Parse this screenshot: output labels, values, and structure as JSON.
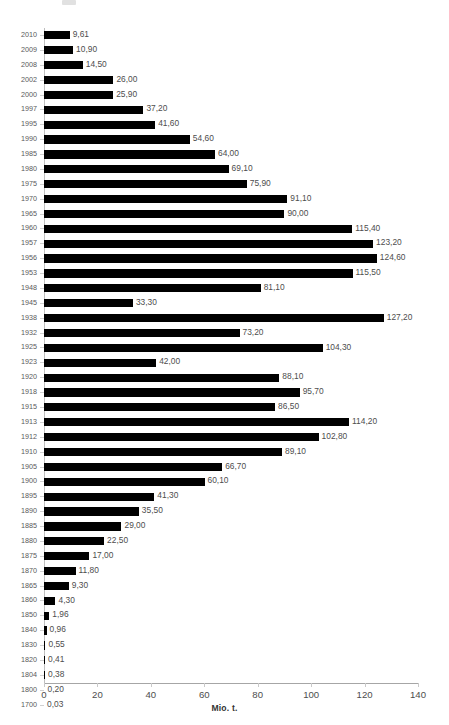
{
  "chart_data": {
    "type": "bar",
    "orientation": "horizontal",
    "title": "",
    "xlabel": "Mio. t.",
    "ylabel": "",
    "xlim": [
      0,
      140
    ],
    "xticks": [
      0,
      20,
      40,
      60,
      80,
      100,
      120,
      140
    ],
    "xtick_labels": [
      "0",
      "20",
      "40",
      "60",
      "80",
      "100",
      "120",
      "140"
    ],
    "grid": false,
    "legend": null,
    "bar_color": "#000000",
    "axis_color": "#bfbfbf",
    "decimal_separator": ",",
    "categories": [
      "2010",
      "2009",
      "2008",
      "2002",
      "2000",
      "1997",
      "1995",
      "1990",
      "1985",
      "1980",
      "1975",
      "1970",
      "1965",
      "1960",
      "1957",
      "1956",
      "1953",
      "1948",
      "1945",
      "1938",
      "1932",
      "1925",
      "1923",
      "1920",
      "1918",
      "1915",
      "1913",
      "1912",
      "1910",
      "1905",
      "1900",
      "1895",
      "1890",
      "1885",
      "1880",
      "1875",
      "1870",
      "1865",
      "1860",
      "1850",
      "1840",
      "1830",
      "1820",
      "1804",
      "1800",
      "1700"
    ],
    "values": [
      9.61,
      10.9,
      14.5,
      26.0,
      25.9,
      37.2,
      41.6,
      54.6,
      64.0,
      69.1,
      75.9,
      91.1,
      90.0,
      115.4,
      123.2,
      124.6,
      115.5,
      81.1,
      33.3,
      127.2,
      73.2,
      104.3,
      42.0,
      88.1,
      95.7,
      86.5,
      114.2,
      102.8,
      89.1,
      66.7,
      60.1,
      41.3,
      35.5,
      29.0,
      22.5,
      17.0,
      11.8,
      9.3,
      4.3,
      1.96,
      0.96,
      0.55,
      0.41,
      0.38,
      0.2,
      0.03
    ],
    "data_labels": [
      "9,61",
      "10,90",
      "14,50",
      "26,00",
      "25,90",
      "37,20",
      "41,60",
      "54,60",
      "64,00",
      "69,10",
      "75,90",
      "91,10",
      "90,00",
      "115,40",
      "123,20",
      "124,60",
      "115,50",
      "81,10",
      "33,30",
      "127,20",
      "73,20",
      "104,30",
      "42,00",
      "88,10",
      "95,70",
      "86,50",
      "114,20",
      "102,80",
      "89,10",
      "66,70",
      "60,10",
      "41,30",
      "35,50",
      "29,00",
      "22,50",
      "17,00",
      "11,80",
      "9,30",
      "4,30",
      "1,96",
      "0,96",
      "0,55",
      "0,41",
      "0,38",
      "0,20",
      "0,03"
    ]
  }
}
